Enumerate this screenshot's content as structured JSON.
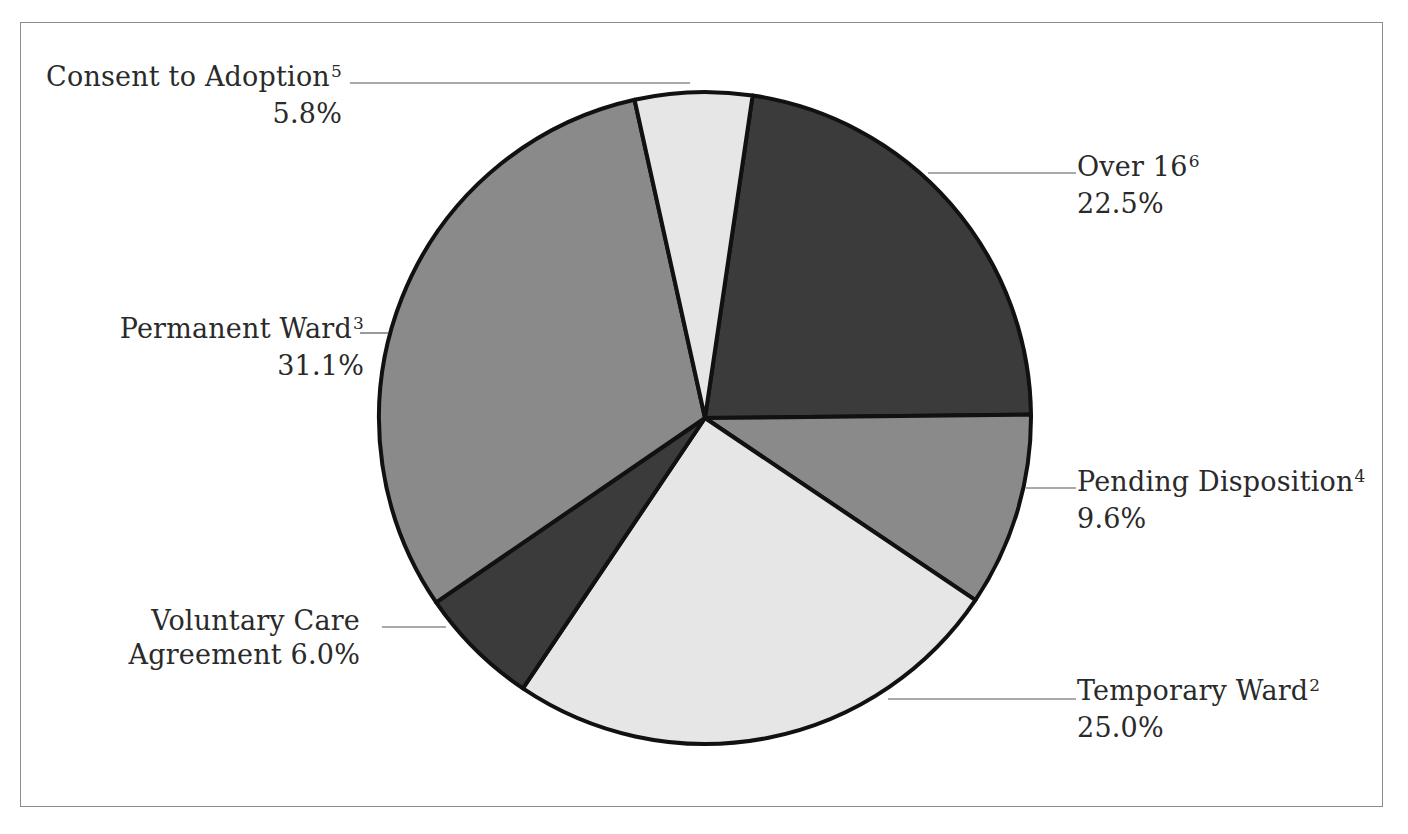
{
  "chart_data": {
    "type": "pie",
    "title": "",
    "start_angle_deg": 8.4,
    "direction": "clockwise",
    "slices": [
      {
        "label": "Over 16",
        "footnote": "6",
        "value": 22.5,
        "display": "22.5%",
        "color": "#3b3b3b"
      },
      {
        "label": "Pending Disposition",
        "footnote": "4",
        "value": 9.6,
        "display": "9.6%",
        "color": "#8a8a8a"
      },
      {
        "label": "Temporary Ward",
        "footnote": "2",
        "value": 25.0,
        "display": "25.0%",
        "color": "#e6e6e6"
      },
      {
        "label": "Voluntary Care Agreement",
        "footnote": "",
        "value": 6.0,
        "display": "6.0%",
        "color": "#3b3b3b"
      },
      {
        "label": "Permanent Ward",
        "footnote": "3",
        "value": 31.1,
        "display": "31.1%",
        "color": "#8a8a8a"
      },
      {
        "label": "Consent to Adoption",
        "footnote": "5",
        "value": 5.8,
        "display": "5.8%",
        "color": "#e6e6e6"
      }
    ],
    "legend": "none (callout labels with leader lines)"
  },
  "labels": {
    "over16": {
      "name": "Over 16",
      "sup": "6",
      "pct": "22.5%"
    },
    "pending": {
      "name": "Pending Disposition",
      "sup": "4",
      "pct": "9.6%"
    },
    "temporary": {
      "name": "Temporary Ward",
      "sup": "2",
      "pct": "25.0%"
    },
    "voluntary": {
      "line1": "Voluntary Care",
      "line2": "Agreement 6.0%"
    },
    "permanent": {
      "name": "Permanent Ward",
      "sup": "3",
      "pct": "31.1%"
    },
    "consent": {
      "name": "Consent to Adoption",
      "sup": "5",
      "pct": "5.8%"
    }
  },
  "style": {
    "outline_color": "#111111",
    "leader_color": "#555555",
    "frame_color": "#8c8c8c"
  }
}
